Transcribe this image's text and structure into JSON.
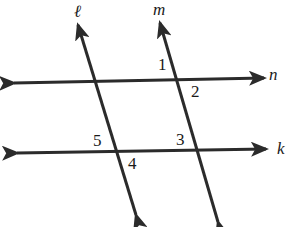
{
  "diagram": {
    "stroke_color": "#2b2b2b",
    "background": "#ffffff",
    "lines": [
      {
        "name": "l",
        "label": "ℓ",
        "from": [
          136,
          215
        ],
        "to": [
          78,
          25
        ],
        "arrows": "both",
        "label_pos": [
          74,
          17
        ]
      },
      {
        "name": "m",
        "label": "m",
        "from": [
          218,
          222
        ],
        "to": [
          160,
          23
        ],
        "arrows": "both",
        "label_pos": [
          153,
          15
        ]
      },
      {
        "name": "n",
        "label": "n",
        "from": [
          14,
          83
        ],
        "to": [
          264,
          78
        ],
        "arrows": "both",
        "label_pos": [
          269,
          80
        ]
      },
      {
        "name": "k",
        "label": "k",
        "from": [
          17,
          153
        ],
        "to": [
          266,
          149
        ],
        "arrows": "both",
        "label_pos": [
          277,
          154
        ]
      }
    ],
    "angle_labels": [
      {
        "label": "1",
        "pos": [
          158,
          70
        ]
      },
      {
        "label": "2",
        "pos": [
          191,
          97
        ]
      },
      {
        "label": "3",
        "pos": [
          176,
          145
        ]
      },
      {
        "label": "4",
        "pos": [
          128,
          169
        ]
      },
      {
        "label": "5",
        "pos": [
          93,
          146
        ]
      }
    ],
    "intersections": {
      "l_n": [
        95,
        82
      ],
      "m_n": [
        178,
        80
      ],
      "l_k": [
        117,
        152
      ],
      "m_k": [
        199,
        151
      ]
    }
  }
}
